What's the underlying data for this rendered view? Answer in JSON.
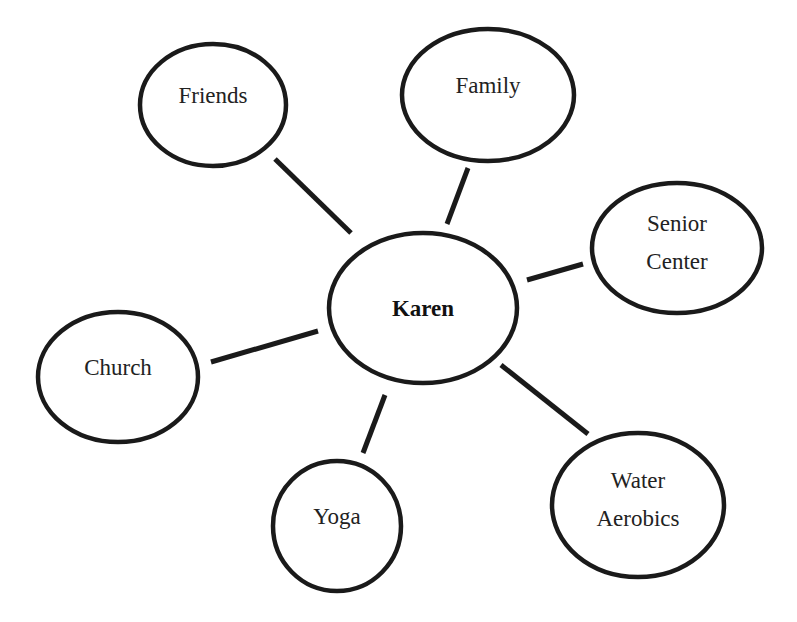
{
  "diagram": {
    "type": "concept-map",
    "center": {
      "id": "karen",
      "label": "Karen",
      "cx": 423,
      "cy": 308,
      "rx": 94,
      "ry": 75
    },
    "nodes": [
      {
        "id": "friends",
        "lines": [
          "Friends"
        ],
        "cx": 213,
        "cy": 105,
        "rx": 73,
        "ry": 61,
        "edge": [
          275,
          159,
          351,
          233
        ]
      },
      {
        "id": "family",
        "lines": [
          "Family"
        ],
        "cx": 488,
        "cy": 95,
        "rx": 86,
        "ry": 66,
        "edge": [
          468,
          168,
          447,
          224
        ]
      },
      {
        "id": "senior-center",
        "lines": [
          "Senior",
          "Center"
        ],
        "cx": 677,
        "cy": 248,
        "rx": 85,
        "ry": 65,
        "edge": [
          583,
          264,
          527,
          280
        ]
      },
      {
        "id": "church",
        "lines": [
          "Church"
        ],
        "cx": 118,
        "cy": 377,
        "rx": 80,
        "ry": 65,
        "edge": [
          211,
          362,
          318,
          331
        ]
      },
      {
        "id": "yoga",
        "lines": [
          "Yoga"
        ],
        "cx": 337,
        "cy": 526,
        "rx": 64,
        "ry": 65,
        "edge": [
          385,
          395,
          363,
          453
        ]
      },
      {
        "id": "water-aerobics",
        "lines": [
          "Water",
          "Aerobics"
        ],
        "cx": 638,
        "cy": 505,
        "rx": 86,
        "ry": 72,
        "edge": [
          501,
          365,
          588,
          434
        ]
      }
    ],
    "colors": {
      "stroke": "#1a1a1a",
      "text": "#222222",
      "background": "#ffffff"
    }
  }
}
